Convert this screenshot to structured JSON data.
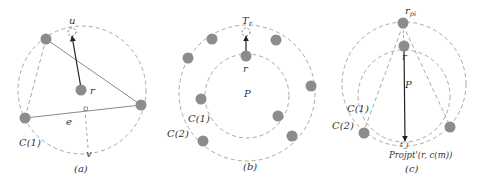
{
  "colors": {
    "node": "#8c8c8c",
    "dashed": "#a8a8a8",
    "line": "#8a8a8a",
    "arrow": "#222222",
    "text": "#333333"
  },
  "panels": [
    {
      "id": "a",
      "caption": "(a)",
      "labels": {
        "u": "u",
        "r": "r",
        "e": "e",
        "v": "v",
        "circle": "C(1)"
      }
    },
    {
      "id": "b",
      "caption": "(b)",
      "labels": {
        "target": "T_r",
        "target_main": "T",
        "target_sub": "r",
        "r": "r",
        "polygon": "P",
        "inner_circle": "C(1)",
        "outer_circle": "C(2)"
      }
    },
    {
      "id": "c",
      "caption": "(c)",
      "labels": {
        "rpi_main": "r",
        "rpi_sub": "pi",
        "r": "r",
        "polygon": "P",
        "inner_circle": "C(1)",
        "outer_circle": "C(2)",
        "projection": "Projpt'(r, c(m))",
        "projection_point": "t_j"
      }
    }
  ]
}
